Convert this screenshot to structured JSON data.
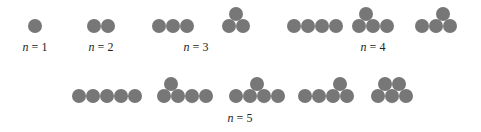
{
  "style": {
    "dot_color": "#777777",
    "dot_diameter": 14
  },
  "groups": [
    {
      "n": 1,
      "label": "n = 1",
      "label_pos": [
        35,
        40
      ],
      "arrangements": [
        [
          [
            35,
            26
          ]
        ]
      ]
    },
    {
      "n": 2,
      "label": "n = 2",
      "label_pos": [
        101,
        40
      ],
      "arrangements": [
        [
          [
            94,
            26
          ],
          [
            108,
            26
          ]
        ]
      ]
    },
    {
      "n": 3,
      "label": "n = 3",
      "label_pos": [
        196,
        40
      ],
      "arrangements": [
        [
          [
            159,
            26
          ],
          [
            173,
            26
          ],
          [
            187,
            26
          ]
        ],
        [
          [
            229,
            26
          ],
          [
            243,
            26
          ],
          [
            236,
            14
          ]
        ]
      ]
    },
    {
      "n": 4,
      "label": "n = 4",
      "label_pos": [
        373,
        40
      ],
      "arrangements": [
        [
          [
            294,
            26
          ],
          [
            308,
            26
          ],
          [
            322,
            26
          ],
          [
            336,
            26
          ]
        ],
        [
          [
            359,
            26
          ],
          [
            373,
            26
          ],
          [
            387,
            26
          ],
          [
            366,
            14
          ]
        ],
        [
          [
            422,
            26
          ],
          [
            436,
            26
          ],
          [
            450,
            26
          ],
          [
            443,
            14
          ]
        ]
      ]
    },
    {
      "n": 5,
      "label": "n = 5",
      "label_pos": [
        240,
        111
      ],
      "arrangements": [
        [
          [
            79,
            96
          ],
          [
            93,
            96
          ],
          [
            107,
            96
          ],
          [
            121,
            96
          ],
          [
            135,
            96
          ]
        ],
        [
          [
            164,
            96
          ],
          [
            178,
            96
          ],
          [
            192,
            96
          ],
          [
            206,
            96
          ],
          [
            171,
            84
          ]
        ],
        [
          [
            236,
            96
          ],
          [
            250,
            96
          ],
          [
            264,
            96
          ],
          [
            278,
            96
          ],
          [
            257,
            84
          ]
        ],
        [
          [
            305,
            96
          ],
          [
            319,
            96
          ],
          [
            333,
            96
          ],
          [
            347,
            96
          ],
          [
            340,
            84
          ]
        ],
        [
          [
            378,
            96
          ],
          [
            392,
            96
          ],
          [
            406,
            96
          ],
          [
            385,
            84
          ],
          [
            399,
            84
          ]
        ]
      ]
    }
  ]
}
